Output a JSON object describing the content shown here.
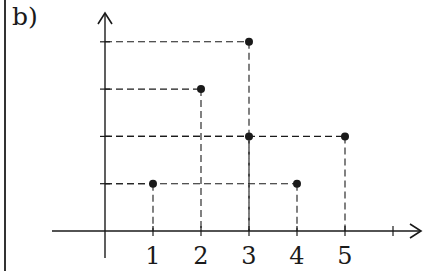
{
  "panel_label": "b)",
  "chart_data": {
    "type": "scatter",
    "title": "",
    "xlabel": "",
    "ylabel": "",
    "x_ticks": [
      1,
      2,
      3,
      4,
      5
    ],
    "x_tick_labels": [
      "1",
      "2",
      "3",
      "4",
      "5"
    ],
    "y_ticks": [
      1,
      2,
      3,
      4
    ],
    "y_tick_labels": [],
    "xlim": [
      0,
      6.5
    ],
    "ylim": [
      0,
      4.5
    ],
    "grid": false,
    "dashed_projection_lines": true,
    "points": [
      {
        "x": 1,
        "y": 1
      },
      {
        "x": 2,
        "y": 3
      },
      {
        "x": 3,
        "y": 4
      },
      {
        "x": 3,
        "y": 2
      },
      {
        "x": 4,
        "y": 1
      },
      {
        "x": 5,
        "y": 2
      }
    ],
    "colors": {
      "ink": "#1a1a1a"
    }
  }
}
